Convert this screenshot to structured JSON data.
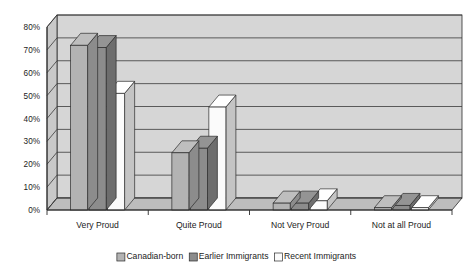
{
  "chart_data": {
    "type": "bar",
    "title": "",
    "subtitle": "",
    "xlabel": "",
    "ylabel": "",
    "categories": [
      "Very Proud",
      "Quite Proud",
      "Not Very Proud",
      "Not at all Proud"
    ],
    "series": [
      {
        "name": "Canadian-born",
        "color": "#b3b3b3",
        "values": [
          72,
          25,
          3,
          1
        ]
      },
      {
        "name": "Earlier Immigrants",
        "color": "#8c8c8c",
        "values": [
          71,
          27,
          3,
          2
        ]
      },
      {
        "name": "Recent Immigrants",
        "color": "#fbfbfb",
        "values": [
          51,
          45,
          4,
          1
        ]
      }
    ],
    "ylim": [
      0,
      80
    ],
    "ytick_values": [
      0,
      10,
      20,
      30,
      40,
      50,
      60,
      70,
      80
    ],
    "ytick_labels": [
      "0%",
      "10%",
      "20%",
      "30%",
      "40%",
      "50%",
      "60%",
      "70%",
      "80%"
    ],
    "grid": true,
    "grid_axis": "y",
    "legend_position": "bottom",
    "style": "3d-grouped-bars",
    "colors": {
      "plot_background": "#c9c9c9",
      "wall_top": "#d6d6d6",
      "floor": "#bdbdbd",
      "grid_line": "#3a3a3a",
      "axis_line": "#2b2b2b",
      "bar_outline": "#2b2b2b",
      "text": "#1c1c1c",
      "page_background": "#ffffff"
    }
  },
  "legend": {
    "items": [
      {
        "label": "Canadian-born",
        "swatch": "#b3b3b3"
      },
      {
        "label": "Earlier Immigrants",
        "swatch": "#8c8c8c"
      },
      {
        "label": "Recent Immigrants",
        "swatch": "#fbfbfb"
      }
    ]
  }
}
